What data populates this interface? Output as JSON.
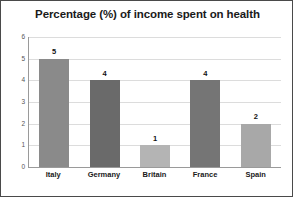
{
  "chart_data": {
    "type": "bar",
    "title": "Percentage (%) of income spent on health",
    "xlabel": "",
    "ylabel": "",
    "categories": [
      "Italy",
      "Germany",
      "Britain",
      "France",
      "Spain"
    ],
    "values": [
      5,
      4,
      1,
      4,
      2
    ],
    "data_labels": [
      "5",
      "4",
      "1",
      "4",
      "2"
    ],
    "ylim": [
      0,
      6
    ],
    "yticks": [
      6,
      5,
      4,
      3,
      2,
      1,
      0
    ],
    "ytick_labels": [
      "6",
      "5",
      "4",
      "3",
      "2",
      "1",
      "0"
    ],
    "grid": true,
    "legend": false,
    "bar_colors": [
      "#8a8a8a",
      "#6a6a6a",
      "#b4b4b4",
      "#757575",
      "#a8a8a8"
    ]
  },
  "style": {
    "frame_border_color": "#4a4a4a",
    "background": "#ffffff",
    "gridline_color": "#dcdcdc",
    "axis_color": "#9a9a9a",
    "title_color": "#1a1a1a"
  }
}
